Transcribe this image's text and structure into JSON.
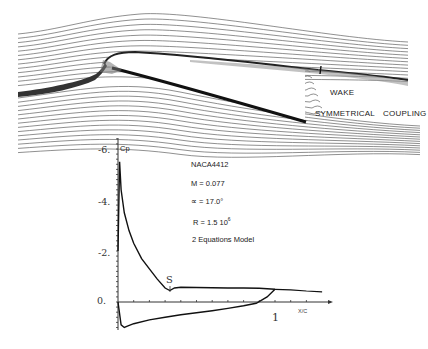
{
  "flow_figure": {
    "labels": {
      "wake": "WAKE",
      "coupling": "SYMMETRICAL COUPLING"
    }
  },
  "chart_data": {
    "type": "line",
    "title": "",
    "xlabel": "X/C",
    "ylabel": "Cp",
    "yticks": [
      "-6.",
      "-4.",
      "-2.",
      "0."
    ],
    "xticks": [
      "1"
    ],
    "ylim": [
      1.2,
      -6.3
    ],
    "xlim": [
      0,
      1.3
    ],
    "y_inverted": true,
    "grid": false,
    "annotations": [
      {
        "text": "S",
        "x": 0.33,
        "y": -0.45,
        "meaning": "separation point"
      },
      {
        "text": "NACA4412"
      },
      {
        "text": "M = 0.077"
      },
      {
        "text": "∝ = 17.0°"
      },
      {
        "text": "R = 1.5 10⁶"
      },
      {
        "text": "2 Equations Model"
      }
    ],
    "series": [
      {
        "name": "upper surface",
        "x": [
          0.0,
          0.01,
          0.02,
          0.04,
          0.07,
          0.1,
          0.15,
          0.2,
          0.25,
          0.3,
          0.33,
          0.36,
          0.4,
          0.5,
          0.6,
          0.7,
          0.8,
          0.9,
          1.0
        ],
        "y": [
          -2.0,
          -5.5,
          -4.4,
          -3.5,
          -2.8,
          -2.3,
          -1.7,
          -1.3,
          -0.9,
          -0.55,
          -0.45,
          -0.55,
          -0.58,
          -0.57,
          -0.56,
          -0.55,
          -0.55,
          -0.54,
          -0.5
        ]
      },
      {
        "name": "lower surface",
        "x": [
          0.0,
          0.02,
          0.04,
          0.06,
          0.1,
          0.2,
          0.3,
          0.4,
          0.5,
          0.6,
          0.7,
          0.8,
          0.88,
          0.95,
          1.0
        ],
        "y": [
          0.0,
          0.9,
          1.0,
          0.95,
          0.85,
          0.7,
          0.6,
          0.5,
          0.42,
          0.34,
          0.25,
          0.15,
          0.05,
          -0.2,
          -0.5
        ]
      },
      {
        "name": "wake",
        "x": [
          1.0,
          1.1,
          1.2,
          1.3
        ],
        "y": [
          -0.5,
          -0.48,
          -0.43,
          -0.4
        ]
      }
    ]
  },
  "info": {
    "airfoil": "NACA4412",
    "mach": "M = 0.077",
    "alpha": "∝ = 17.0°",
    "reynolds_base": "R = 1.5 10",
    "reynolds_exp": "6",
    "model": "2 Equations Model"
  },
  "axis": {
    "ylabel": "Cp",
    "xlabel": "X/C",
    "yticks": [
      "-6.",
      "-4.",
      "-2.",
      "0."
    ],
    "xtick_one": "1",
    "sep_label": "S"
  }
}
